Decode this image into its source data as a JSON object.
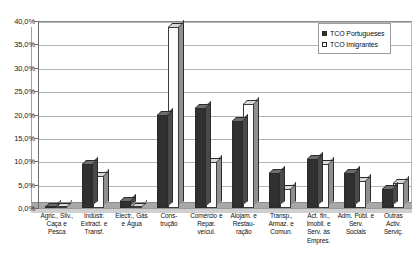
{
  "chart_data": {
    "type": "bar",
    "title": "(cont.)",
    "xlabel": "",
    "ylabel": "",
    "ylim": [
      0,
      40
    ],
    "ytick_step": 5,
    "ytick_labels": [
      "0,0%",
      "5,0%",
      "10,0%",
      "15,0%",
      "20,0%",
      "25,0%",
      "30,0%",
      "35,0%",
      "40,0%"
    ],
    "grid": true,
    "legend_position": "top-right",
    "style": "3d-column",
    "categories": [
      "Agric., Silv., Caça e Pesca",
      "Indústr. Extract. e Transf.",
      "Electr., Gás e Água",
      "Cons- trução",
      "Comércio e Repar. veícul.",
      "Alojam. e Restau- ração",
      "Transp., Armaz. e Comun.",
      "Act. fin., Imobil. e Serv. às Empres.",
      "Adm. Públ. e Serv. Sociais",
      "Outras Activ. Serviç."
    ],
    "category_lines": [
      [
        "Agric., Silv.,",
        "Caça e",
        "Pesca"
      ],
      [
        "Indústr.",
        "Extract. e",
        "Transf."
      ],
      [
        "Electr., Gás",
        "e Água"
      ],
      [
        "Cons-",
        "trução"
      ],
      [
        "Comércio e",
        "Repar.",
        "veícul."
      ],
      [
        "Alojam. e",
        "Restau-",
        "ração"
      ],
      [
        "Transp.,",
        "Armaz. e",
        "Comun."
      ],
      [
        "Act. fin.,",
        "Imobil. e",
        "Serv. às",
        "Empres."
      ],
      [
        "Adm. Públ. e",
        "Serv.",
        "Sociais"
      ],
      [
        "Outras",
        "Activ.",
        "Serviç."
      ]
    ],
    "series": [
      {
        "name": "TCO Portugueses",
        "color": "#303030",
        "values": [
          0.3,
          9.4,
          1.5,
          20.0,
          21.5,
          18.7,
          7.5,
          10.5,
          7.5,
          4.0
        ]
      },
      {
        "name": "TCO Imigrantes",
        "color": "#ffffff",
        "values": [
          0.2,
          6.9,
          0.2,
          38.8,
          9.8,
          22.2,
          4.0,
          9.5,
          5.8,
          5.3
        ]
      }
    ]
  },
  "legend": {
    "items": [
      {
        "label": "TCO Portugueses",
        "swatch": "dark-square-swatch"
      },
      {
        "label": "TCO Imigrantes",
        "swatch": "hollow-square-swatch"
      }
    ]
  }
}
